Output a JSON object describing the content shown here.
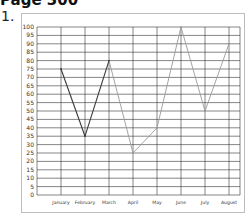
{
  "page": {
    "title": "Page 300",
    "question_number": "1."
  },
  "colors": {
    "grid": "#333333",
    "frame": "#bdbdbd",
    "line_dark": "#3a3a3a",
    "line_light": "#9a9a9a"
  },
  "chart_data": {
    "type": "line",
    "title": "",
    "xlabel": "",
    "ylabel": "",
    "categories": [
      "January",
      "February",
      "March",
      "April",
      "May",
      "June",
      "July",
      "August"
    ],
    "series": [
      {
        "name": "values",
        "values": [
          75,
          35,
          80,
          25,
          40,
          100,
          50,
          90
        ]
      }
    ],
    "segment_style": "January–March drawn darker; March–August drawn lighter grey",
    "yticks": [
      0,
      5,
      10,
      15,
      20,
      25,
      30,
      35,
      40,
      45,
      50,
      55,
      60,
      65,
      70,
      75,
      80,
      85,
      90,
      95,
      100
    ],
    "ylim": [
      0,
      100
    ],
    "grid": true,
    "legend": "none"
  }
}
